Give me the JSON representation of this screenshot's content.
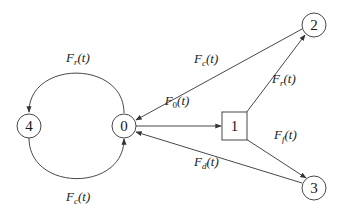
{
  "diagram": {
    "type": "state-transition-graph",
    "colors": {
      "stroke": "#333333",
      "text": "#1a1a1a",
      "background": "#ffffff"
    },
    "nodes": [
      {
        "id": "0",
        "label": "0",
        "shape": "circle"
      },
      {
        "id": "1",
        "label": "1",
        "shape": "square"
      },
      {
        "id": "2",
        "label": "2",
        "shape": "circle"
      },
      {
        "id": "3",
        "label": "3",
        "shape": "circle"
      },
      {
        "id": "4",
        "label": "4",
        "shape": "circle"
      }
    ],
    "edges": [
      {
        "from": "0",
        "to": "1",
        "label_main": "F",
        "label_sub": "0",
        "label_arg": "(t)"
      },
      {
        "from": "1",
        "to": "2",
        "label_main": "F",
        "label_sub": "r",
        "label_arg": "(t)"
      },
      {
        "from": "1",
        "to": "3",
        "label_main": "F",
        "label_sub": "f",
        "label_arg": "(t)"
      },
      {
        "from": "2",
        "to": "0",
        "label_main": "F",
        "label_sub": "c",
        "label_arg": "(t)"
      },
      {
        "from": "3",
        "to": "0",
        "label_main": "F",
        "label_sub": "d",
        "label_arg": "(t)"
      },
      {
        "from": "0",
        "to": "4",
        "label_main": "F",
        "label_sub": "r",
        "label_arg": "(t)"
      },
      {
        "from": "4",
        "to": "0",
        "label_main": "F",
        "label_sub": "c",
        "label_arg": "(t)"
      }
    ]
  }
}
